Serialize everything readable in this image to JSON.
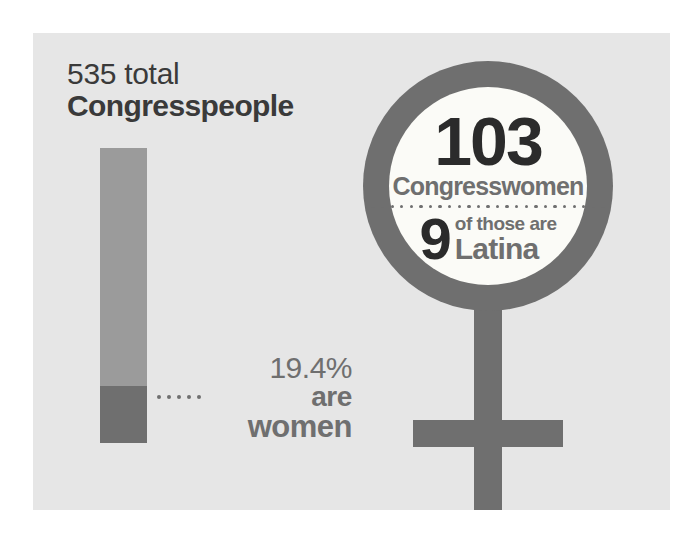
{
  "infographic": {
    "left_panel": {
      "heading_line1": "535 total",
      "heading_line2": "Congresspeople",
      "callout_percent": "19.4%",
      "callout_line2": "are",
      "callout_line3": "women"
    },
    "venus_symbol": {
      "stat_primary": "103",
      "stat_primary_label": "Congresswomen",
      "stat_secondary": "9",
      "stat_secondary_label_line1": "of those are",
      "stat_secondary_label_line2": "Latina"
    }
  },
  "colors": {
    "panel_background": "#e6e6e6",
    "bar_light": "#9b9b9b",
    "bar_dark": "#6f6f6f",
    "symbol_gray": "#6f6f6f",
    "circle_fill": "#fbfbf7",
    "text_dark": "#2b2b2b",
    "text_gray": "#6f6f6f",
    "heading_text": "#3a3a3a"
  },
  "chart_data": {
    "type": "bar",
    "title": "535 total Congresspeople",
    "categories": [
      "Men",
      "Women"
    ],
    "values": [
      80.6,
      19.4
    ],
    "value_unit": "percent",
    "counts": [
      432,
      103
    ],
    "total": 535,
    "xlabel": "",
    "ylabel": "",
    "ylim": [
      0,
      100
    ],
    "grid": false,
    "legend": false,
    "orientation": "vertical-stacked",
    "annotations": [
      "19.4% are women",
      "103 Congresswomen",
      "9 of those are Latina"
    ],
    "highlights": {
      "congresswomen_total": 103,
      "latina_congresswomen": 9,
      "women_share_percent": 19.4
    }
  }
}
